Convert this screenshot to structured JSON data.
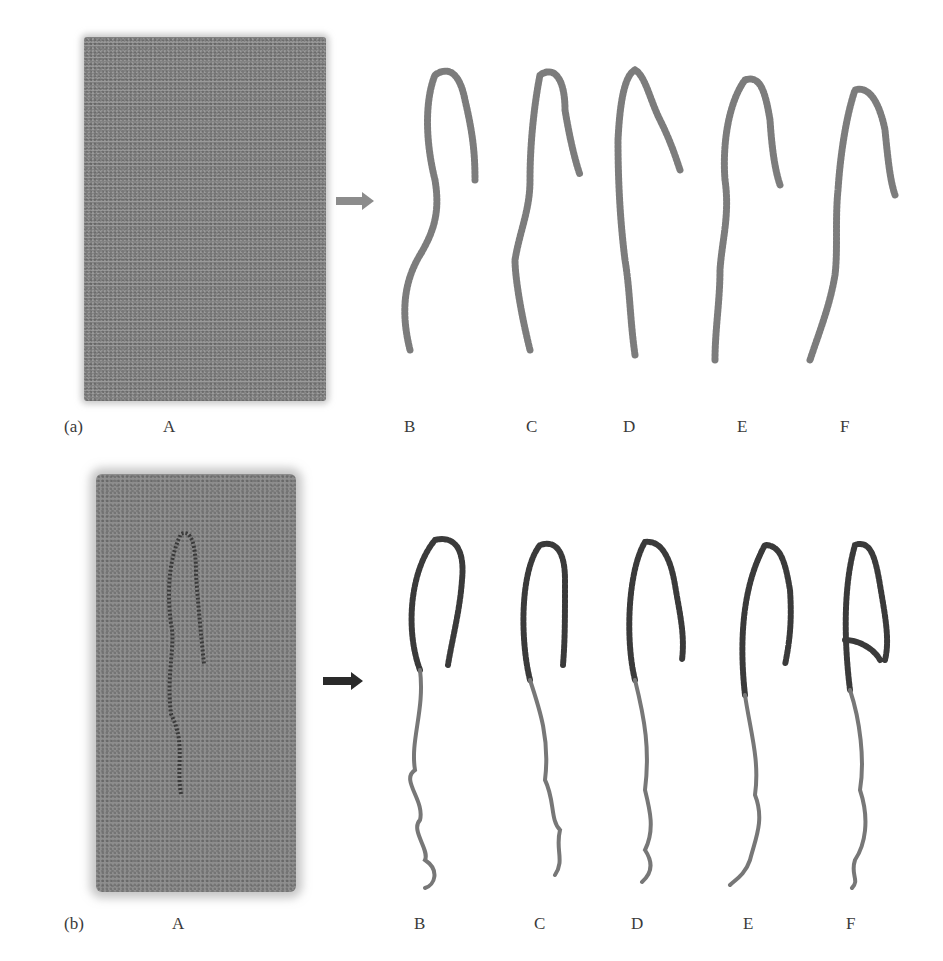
{
  "figure": {
    "panel_a": {
      "tag": "(a)",
      "subpanels": [
        "A",
        "B",
        "C",
        "D",
        "E",
        "F"
      ],
      "arrow_color": "#8c8c8c",
      "description": "Solvated box and extracted conformations (atomistic stick representation)"
    },
    "panel_b": {
      "tag": "(b)",
      "subpanels": [
        "A",
        "B",
        "C",
        "D",
        "E",
        "F"
      ],
      "arrow_color": "#2a2a2a",
      "description": "Solvated box and extracted conformations (cartoon/ribbon representation)"
    },
    "colors": {
      "background": "#ffffff",
      "solvent_box": "#9a9a9a",
      "stick_molecule": "#6e6e6e",
      "ribbon_helix": "#3a3a3a",
      "ribbon_coil": "#7a7a7a"
    }
  }
}
